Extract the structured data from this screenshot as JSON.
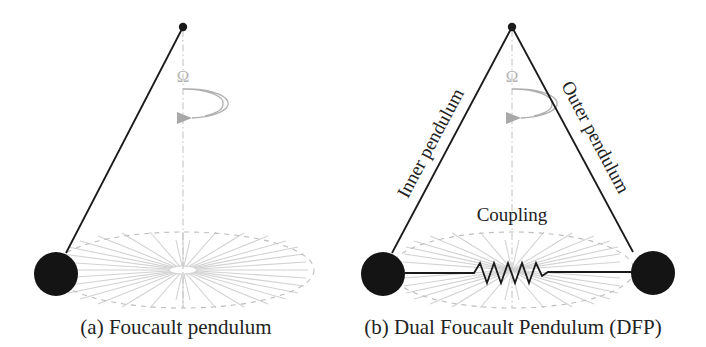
{
  "figure": {
    "panels": [
      {
        "id": "a",
        "caption": "(a) Foucault pendulum",
        "rotation_symbol": "Ω",
        "elements": [
          "pivot",
          "string",
          "bob",
          "rotation-arrow",
          "vertical-axis",
          "oscillation-plane-ellipse",
          "swing-traces"
        ]
      },
      {
        "id": "b",
        "caption": "(b) Dual Foucault Pendulum (DFP)",
        "rotation_symbol": "Ω",
        "labels": {
          "inner": "Inner pendulum",
          "outer": "Outer pendulum",
          "coupling": "Coupling"
        },
        "elements": [
          "pivot",
          "inner-string",
          "outer-string",
          "inner-bob",
          "outer-bob",
          "coupling-spring",
          "rotation-arrow",
          "vertical-axis",
          "oscillation-plane-ellipse",
          "swing-traces"
        ]
      }
    ],
    "colors": {
      "ink": "#1a1a1a",
      "guide": "#b8b8b8",
      "trace": "#cfcfcf",
      "background": "#ffffff"
    }
  }
}
